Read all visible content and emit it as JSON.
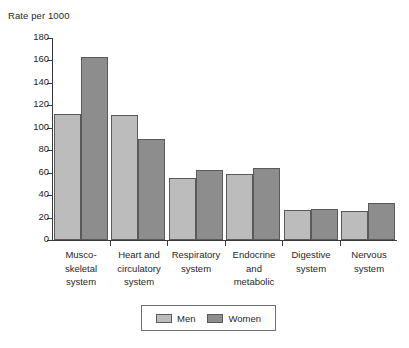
{
  "chart_data": {
    "type": "bar",
    "title": "",
    "xlabel": "",
    "ylabel": "Rate per 1000",
    "ylim": [
      0,
      180
    ],
    "ytick_step": 20,
    "yticks": [
      180,
      160,
      140,
      120,
      100,
      80,
      60,
      40,
      20,
      0
    ],
    "grid": false,
    "legend_position": "bottom-center",
    "categories": [
      "Musco-skeletal system",
      "Heart and circulatory system",
      "Respiratory system",
      "Endocrine and metabolic",
      "Digestive system",
      "Nervous system"
    ],
    "category_label_lines": [
      [
        "Musco-",
        "skeletal",
        "system"
      ],
      [
        "Heart and",
        "circulatory",
        "system"
      ],
      [
        "Respiratory",
        "system"
      ],
      [
        "Endocrine",
        "and",
        "metabolic"
      ],
      [
        "Digestive",
        "system"
      ],
      [
        "Nervous",
        "system"
      ]
    ],
    "series": [
      {
        "name": "Men",
        "color": "#bcbcbc",
        "values": [
          112,
          111,
          55,
          59,
          27,
          26
        ]
      },
      {
        "name": "Women",
        "color": "#8d8d8d",
        "values": [
          163,
          90,
          62,
          64,
          28,
          33
        ]
      }
    ]
  },
  "legend": {
    "items": [
      {
        "label": "Men",
        "color": "#bcbcbc"
      },
      {
        "label": "Women",
        "color": "#8d8d8d"
      }
    ]
  },
  "axis": {
    "y_title": "Rate per 1000"
  },
  "colors": {
    "men_fill": "#bcbcbc",
    "women_fill": "#8d8d8d",
    "bar_outline": "#5a5a5a",
    "axis": "#3a3a3a",
    "text": "#1f1f1f",
    "background": "#ffffff"
  }
}
